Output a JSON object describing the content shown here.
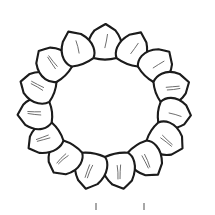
{
  "figure": {
    "style": "pen-and-ink line drawing",
    "canvas": {
      "width": 215,
      "height": 215,
      "background": "#ffffff"
    },
    "ink_color": "#1a1a1a",
    "fill_color": "#ffffff",
    "hatch_color": "#2b2b2b",
    "vein_color": "#555555",
    "tick_color": "#8a8a8a"
  },
  "ring": {
    "center_x": 105,
    "center_y": 107,
    "inner_radius_x": 56,
    "inner_radius_y": 50,
    "petal_count": 15,
    "petal_length": 34,
    "petal_half_width": 20,
    "start_angle_deg": -90,
    "label": "petal-ring"
  },
  "petals": [
    {
      "index": 1,
      "angle_deg": -90,
      "name": "petal-top-center",
      "veins": 1
    },
    {
      "index": 2,
      "angle_deg": -66,
      "name": "petal-top-right-1",
      "veins": 1
    },
    {
      "index": 3,
      "angle_deg": -42,
      "name": "petal-top-right-2",
      "veins": 1
    },
    {
      "index": 4,
      "angle_deg": -18,
      "name": "petal-right-upper",
      "veins": 2
    },
    {
      "index": 5,
      "angle_deg": 6,
      "name": "petal-right-center",
      "veins": 1
    },
    {
      "index": 6,
      "angle_deg": 30,
      "name": "petal-right-lower",
      "veins": 2
    },
    {
      "index": 7,
      "angle_deg": 54,
      "name": "petal-bottom-right-2",
      "veins": 2
    },
    {
      "index": 8,
      "angle_deg": 78,
      "name": "petal-bottom-right-1",
      "veins": 2
    },
    {
      "index": 9,
      "angle_deg": 102,
      "name": "petal-bottom-center",
      "veins": 2
    },
    {
      "index": 10,
      "angle_deg": 126,
      "name": "petal-bottom-left-1",
      "veins": 2
    },
    {
      "index": 11,
      "angle_deg": 150,
      "name": "petal-bottom-left-2",
      "veins": 2
    },
    {
      "index": 12,
      "angle_deg": 174,
      "name": "petal-left-lower",
      "veins": 2
    },
    {
      "index": 13,
      "angle_deg": 198,
      "name": "petal-left-center",
      "veins": 2
    },
    {
      "index": 14,
      "angle_deg": 222,
      "name": "petal-left-upper",
      "veins": 2
    },
    {
      "index": 15,
      "angle_deg": 246,
      "name": "petal-top-left-1",
      "veins": 1
    }
  ],
  "scale_marks": [
    {
      "name": "scale-tick-left",
      "x": 95,
      "y": 203,
      "width": 2,
      "height": 7
    },
    {
      "name": "scale-tick-right",
      "x": 143,
      "y": 203,
      "width": 2,
      "height": 7
    }
  ],
  "center": {
    "name": "inner-void",
    "fill": "#ffffff",
    "label": ""
  }
}
